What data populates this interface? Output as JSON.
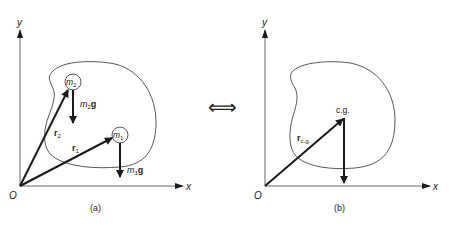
{
  "figure": {
    "panel_a": {
      "caption": "(a)",
      "axis_x_label": "x",
      "axis_y_label": "y",
      "origin_label": "O",
      "mass_2": {
        "symbol": "m",
        "subscript": "2",
        "weight_label_m": "m",
        "weight_label_sub": "2",
        "weight_label_g": "g"
      },
      "mass_1": {
        "symbol": "m",
        "subscript": "1",
        "weight_label_m": "m",
        "weight_label_sub": "1",
        "weight_label_g": "g"
      },
      "vector_r2": {
        "symbol": "r",
        "subscript": "2"
      },
      "vector_r1": {
        "symbol": "r",
        "subscript": "1"
      }
    },
    "equivalence_symbol": "⟺",
    "panel_b": {
      "caption": "(b)",
      "axis_x_label": "x",
      "axis_y_label": "y",
      "origin_label": "O",
      "cg_label": "c.g.",
      "vector_rcg": {
        "symbol": "r",
        "subscript": "c.g."
      }
    },
    "colors": {
      "line": "#1a1a1a",
      "outline": "#444444",
      "axis": "#666666",
      "text": "#222222"
    }
  }
}
